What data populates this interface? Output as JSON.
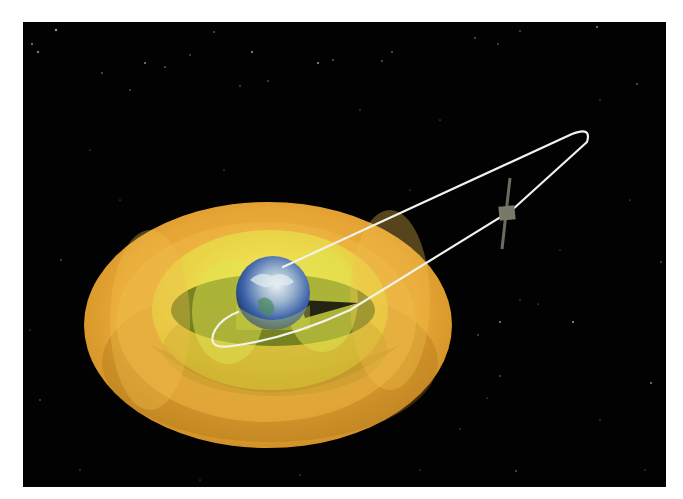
{
  "canvas": {
    "width": 683,
    "height": 499,
    "page_bg": "#ffffff"
  },
  "space_panel": {
    "x": 23,
    "y": 22,
    "width": 643,
    "height": 465,
    "color": "#020202"
  },
  "stars": [
    [
      38,
      52,
      1.1
    ],
    [
      56,
      30,
      1.2
    ],
    [
      32,
      44,
      0.9
    ],
    [
      102,
      73,
      0.8
    ],
    [
      145,
      63,
      0.9
    ],
    [
      165,
      67,
      0.8
    ],
    [
      190,
      55,
      0.7
    ],
    [
      214,
      32,
      0.8
    ],
    [
      240,
      86,
      0.7
    ],
    [
      252,
      52,
      1.0
    ],
    [
      268,
      81,
      0.7
    ],
    [
      318,
      63,
      1.0
    ],
    [
      333,
      60,
      0.8
    ],
    [
      392,
      52,
      0.8
    ],
    [
      382,
      61,
      0.8
    ],
    [
      475,
      38,
      0.8
    ],
    [
      498,
      44,
      0.7
    ],
    [
      520,
      31,
      0.7
    ],
    [
      597,
      27,
      0.9
    ],
    [
      637,
      84,
      0.8
    ],
    [
      130,
      90,
      0.7
    ],
    [
      224,
      170,
      0.6
    ],
    [
      61,
      260,
      0.7
    ],
    [
      40,
      400,
      0.7
    ],
    [
      80,
      470,
      0.6
    ],
    [
      30,
      330,
      0.6
    ],
    [
      500,
      322,
      0.9
    ],
    [
      573,
      322,
      1.0
    ],
    [
      520,
      300,
      0.6
    ],
    [
      478,
      335,
      0.7
    ],
    [
      500,
      376,
      0.7
    ],
    [
      538,
      304,
      0.6
    ],
    [
      651,
      383,
      0.9
    ],
    [
      460,
      429,
      0.6
    ],
    [
      516,
      471,
      0.8
    ],
    [
      487,
      398,
      0.6
    ],
    [
      661,
      262,
      0.7
    ],
    [
      630,
      200,
      0.6
    ],
    [
      600,
      100,
      0.6
    ],
    [
      440,
      120,
      0.6
    ],
    [
      360,
      110,
      0.6
    ],
    [
      90,
      150,
      0.6
    ],
    [
      120,
      200,
      0.5
    ],
    [
      600,
      420,
      0.6
    ],
    [
      645,
      470,
      0.6
    ],
    [
      300,
      475,
      0.6
    ],
    [
      200,
      480,
      0.5
    ],
    [
      420,
      470,
      0.6
    ],
    [
      560,
      250,
      0.5
    ],
    [
      410,
      190,
      0.5
    ]
  ],
  "belts": {
    "center": [
      268,
      325
    ],
    "outer": {
      "rx": 184,
      "ry": 123,
      "color": "#e5a230",
      "edge": "#c98a1f"
    },
    "outer_shadow": {
      "cx": 270,
      "cy": 360,
      "rx": 170,
      "ry": 80,
      "color": "#a8731a",
      "opacity": 0.45
    },
    "mid_ring": {
      "rx": 150,
      "ry": 100,
      "color": "#f0b845",
      "opacity": 0.55
    },
    "inner": {
      "cx": 270,
      "cy": 310,
      "rx": 118,
      "ry": 80,
      "color": "#eadc3a"
    },
    "inner_shadow": {
      "cx": 275,
      "cy": 345,
      "rx": 112,
      "ry": 52,
      "color": "#b89a25",
      "opacity": 0.5
    },
    "slot": {
      "cx": 273,
      "cy": 308,
      "rx": 100,
      "ry": 36,
      "color": "#6b7a1e"
    },
    "slot_lobe_left": {
      "cx": 225,
      "cy": 312,
      "rx": 38,
      "ry": 50,
      "color": "#d8e04a",
      "opacity": 0.55
    },
    "slot_lobe_right": {
      "cx": 325,
      "cy": 300,
      "rx": 38,
      "ry": 50,
      "color": "#d8e04a",
      "opacity": 0.55
    }
  },
  "earth": {
    "cx": 273,
    "cy": 293,
    "r": 37,
    "ocean": "#3d63a8",
    "ocean_dark": "#1f3d7a",
    "cloud": "#e6eef2",
    "land": "#4f8a5a",
    "shadow_tip": {
      "x": 358,
      "y": 303
    }
  },
  "orbit": {
    "stroke": "#f2f2ec",
    "width": 2.2,
    "path": "M 283 267 L 572 134 Q 592 126 587 142 L 512 210 L 350 310 Q 290 338 232 346 Q 205 350 215 330 Q 222 318 238 312"
  },
  "satellite": {
    "x": 507,
    "y": 213,
    "body_color": "#7a7868",
    "panel_color": "#6d6b60",
    "panel_top": [
      510,
      178
    ],
    "panel_bottom": [
      502,
      249
    ]
  }
}
